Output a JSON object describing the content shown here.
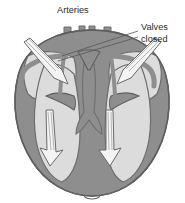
{
  "figure": {
    "title_label": "Arteries",
    "valves_label_line1": "Valves",
    "valves_label_line2": "closed",
    "colors": {
      "background": "#ffffff",
      "myocardium_wall": "#8e8e8e",
      "chamber_lumen": "#dcdcdc",
      "vessel_outline": "#7d7d7d",
      "outline_stroke": "#5e5e5e",
      "arrow_fill": "#f4f4f4",
      "arrow_stroke": "#6a6a6a",
      "leader_line": "#555555",
      "text": "#2b2b2b"
    },
    "annotations": [
      {
        "name": "arteries-label",
        "text": "Arteries",
        "x": 57,
        "y": 13,
        "points_to": "great vessels at top of heart"
      },
      {
        "name": "valves-closed-label",
        "text": "Valves closed",
        "x": 142,
        "y": 26,
        "points_to": "semilunar/atrioventricular valve cusps"
      }
    ],
    "flow_arrows": [
      {
        "name": "flow-arrow-upper-left",
        "direction": "down-right",
        "from": [
          26,
          45
        ],
        "to": [
          62,
          80
        ]
      },
      {
        "name": "flow-arrow-upper-right",
        "direction": "down-left",
        "from": [
          152,
          45
        ],
        "to": [
          116,
          80
        ]
      },
      {
        "name": "flow-arrow-lower-left",
        "direction": "down",
        "from": [
          50,
          112
        ],
        "to": [
          55,
          160
        ]
      },
      {
        "name": "flow-arrow-lower-right",
        "direction": "down",
        "from": [
          112,
          112
        ],
        "to": [
          108,
          160
        ]
      }
    ],
    "vessel_count": 4
  }
}
